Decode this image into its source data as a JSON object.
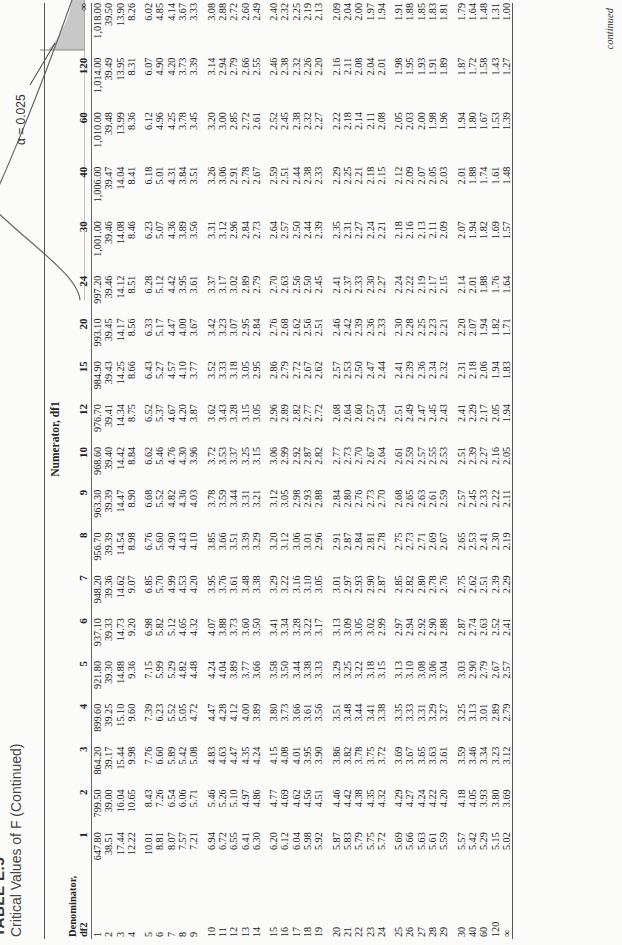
{
  "title": {
    "number": "TABLE E.5",
    "subtitle": "Critical Values of F (Continued)"
  },
  "figure": {
    "alpha_label": "α = 0.025",
    "critical_label": "F_U(α,df1,df2)",
    "zero_label": "0",
    "shade_color": "#c8c8c8"
  },
  "table": {
    "numerator_label": "Numerator, df1",
    "denominator_label_line1": "Denominator,",
    "denominator_label_line2": "df2",
    "columns": [
      "1",
      "2",
      "3",
      "4",
      "5",
      "6",
      "7",
      "8",
      "9",
      "10",
      "12",
      "15",
      "20",
      "24",
      "30",
      "40",
      "60",
      "120",
      "∞"
    ],
    "groups": [
      [
        {
          "df2": "1",
          "v": [
            "647.80",
            "799.50",
            "864.20",
            "899.60",
            "921.80",
            "937.10",
            "948.20",
            "956.70",
            "963.30",
            "968.60",
            "976.70",
            "984.90",
            "993.10",
            "997.20",
            "1,001.00",
            "1,006.00",
            "1,010.00",
            "1,014.00",
            "1,018.00"
          ]
        },
        {
          "df2": "2",
          "v": [
            "38.51",
            "39.00",
            "39.17",
            "39.25",
            "39.30",
            "39.33",
            "39.36",
            "39.39",
            "39.39",
            "39.40",
            "39.41",
            "39.43",
            "39.45",
            "39.46",
            "39.46",
            "39.47",
            "39.48",
            "39.49",
            "39.50"
          ]
        },
        {
          "df2": "3",
          "v": [
            "17.44",
            "16.04",
            "15.44",
            "15.10",
            "14.88",
            "14.73",
            "14.62",
            "14.54",
            "14.47",
            "14.42",
            "14.34",
            "14.25",
            "14.17",
            "14.12",
            "14.08",
            "14.04",
            "13.99",
            "13.95",
            "13.90"
          ]
        },
        {
          "df2": "4",
          "v": [
            "12.22",
            "10.65",
            "9.98",
            "9.60",
            "9.36",
            "9.20",
            "9.07",
            "8.98",
            "8.90",
            "8.84",
            "8.75",
            "8.66",
            "8.56",
            "8.51",
            "8.46",
            "8.41",
            "8.36",
            "8.31",
            "8.26"
          ]
        }
      ],
      [
        {
          "df2": "5",
          "v": [
            "10.01",
            "8.43",
            "7.76",
            "7.39",
            "7.15",
            "6.98",
            "6.85",
            "6.76",
            "6.68",
            "6.62",
            "6.52",
            "6.43",
            "6.33",
            "6.28",
            "6.23",
            "6.18",
            "6.12",
            "6.07",
            "6.02"
          ]
        },
        {
          "df2": "6",
          "v": [
            "8.81",
            "7.26",
            "6.60",
            "6.23",
            "5.99",
            "5.82",
            "5.70",
            "5.60",
            "5.52",
            "5.46",
            "5.37",
            "5.27",
            "5.17",
            "5.12",
            "5.07",
            "5.01",
            "4.96",
            "4.90",
            "4.85"
          ]
        },
        {
          "df2": "7",
          "v": [
            "8.07",
            "6.54",
            "5.89",
            "5.52",
            "5.29",
            "5.12",
            "4.99",
            "4.90",
            "4.82",
            "4.76",
            "4.67",
            "4.57",
            "4.47",
            "4.42",
            "4.36",
            "4.31",
            "4.25",
            "4.20",
            "4.14"
          ]
        },
        {
          "df2": "8",
          "v": [
            "7.57",
            "6.06",
            "5.42",
            "5.05",
            "4.82",
            "4.65",
            "4.53",
            "4.43",
            "4.36",
            "4.30",
            "4.20",
            "4.10",
            "4.00",
            "3.95",
            "3.89",
            "3.84",
            "3.78",
            "3.73",
            "3.67"
          ]
        },
        {
          "df2": "9",
          "v": [
            "7.21",
            "5.71",
            "5.08",
            "4.72",
            "4.48",
            "4.32",
            "4.20",
            "4.10",
            "4.03",
            "3.96",
            "3.87",
            "3.77",
            "3.67",
            "3.61",
            "3.56",
            "3.51",
            "3.45",
            "3.39",
            "3.33"
          ]
        }
      ],
      [
        {
          "df2": "10",
          "v": [
            "6.94",
            "5.46",
            "4.83",
            "4.47",
            "4.24",
            "4.07",
            "3.95",
            "3.85",
            "3.78",
            "3.72",
            "3.62",
            "3.52",
            "3.42",
            "3.37",
            "3.31",
            "3.26",
            "3.20",
            "3.14",
            "3.08"
          ]
        },
        {
          "df2": "11",
          "v": [
            "6.72",
            "5.26",
            "4.63",
            "4.28",
            "4.04",
            "3.88",
            "3.76",
            "3.66",
            "3.59",
            "3.53",
            "3.43",
            "3.33",
            "3.23",
            "3.17",
            "3.12",
            "3.06",
            "3.00",
            "2.94",
            "2.88"
          ]
        },
        {
          "df2": "12",
          "v": [
            "6.55",
            "5.10",
            "4.47",
            "4.12",
            "3.89",
            "3.73",
            "3.61",
            "3.51",
            "3.44",
            "3.37",
            "3.28",
            "3.18",
            "3.07",
            "3.02",
            "2.96",
            "2.91",
            "2.85",
            "2.79",
            "2.72"
          ]
        },
        {
          "df2": "13",
          "v": [
            "6.41",
            "4.97",
            "4.35",
            "4.00",
            "3.77",
            "3.60",
            "3.48",
            "3.39",
            "3.31",
            "3.25",
            "3.15",
            "3.05",
            "2.95",
            "2.89",
            "2.84",
            "2.78",
            "2.72",
            "2.66",
            "2.60"
          ]
        },
        {
          "df2": "14",
          "v": [
            "6.30",
            "4.86",
            "4.24",
            "3.89",
            "3.66",
            "3.50",
            "3.38",
            "3.29",
            "3.21",
            "3.15",
            "3.05",
            "2.95",
            "2.84",
            "2.79",
            "2.73",
            "2.67",
            "2.61",
            "2.55",
            "2.49"
          ]
        }
      ],
      [
        {
          "df2": "15",
          "v": [
            "6.20",
            "4.77",
            "4.15",
            "3.80",
            "3.58",
            "3.41",
            "3.29",
            "3.20",
            "3.12",
            "3.06",
            "2.96",
            "2.86",
            "2.76",
            "2.70",
            "2.64",
            "2.59",
            "2.52",
            "2.46",
            "2.40"
          ]
        },
        {
          "df2": "16",
          "v": [
            "6.12",
            "4.69",
            "4.08",
            "3.73",
            "3.50",
            "3.34",
            "3.22",
            "3.12",
            "3.05",
            "2.99",
            "2.89",
            "2.79",
            "2.68",
            "2.63",
            "2.57",
            "2.51",
            "2.45",
            "2.38",
            "2.32"
          ]
        },
        {
          "df2": "17",
          "v": [
            "6.04",
            "4.62",
            "4.01",
            "3.66",
            "3.44",
            "3.28",
            "3.16",
            "3.06",
            "2.98",
            "2.92",
            "2.82",
            "2.72",
            "2.62",
            "2.56",
            "2.50",
            "2.44",
            "2.38",
            "2.32",
            "2.25"
          ]
        },
        {
          "df2": "18",
          "v": [
            "5.98",
            "4.56",
            "3.95",
            "3.61",
            "3.38",
            "3.22",
            "3.10",
            "3.01",
            "2.93",
            "2.87",
            "2.77",
            "2.67",
            "2.56",
            "2.50",
            "2.44",
            "2.38",
            "2.32",
            "2.26",
            "2.19"
          ]
        },
        {
          "df2": "19",
          "v": [
            "5.92",
            "4.51",
            "3.90",
            "3.56",
            "3.33",
            "3.17",
            "3.05",
            "2.96",
            "2.88",
            "2.82",
            "2.72",
            "2.62",
            "2.51",
            "2.45",
            "2.39",
            "2.33",
            "2.27",
            "2.20",
            "2.13"
          ]
        }
      ],
      [
        {
          "df2": "20",
          "v": [
            "5.87",
            "4.46",
            "3.86",
            "3.51",
            "3.29",
            "3.13",
            "3.01",
            "2.91",
            "2.84",
            "2.77",
            "2.68",
            "2.57",
            "2.46",
            "2.41",
            "2.35",
            "2.29",
            "2.22",
            "2.16",
            "2.09"
          ]
        },
        {
          "df2": "21",
          "v": [
            "5.83",
            "4.42",
            "3.82",
            "3.48",
            "3.25",
            "3.09",
            "2.97",
            "2.87",
            "2.80",
            "2.73",
            "2.64",
            "2.53",
            "2.42",
            "2.37",
            "2.31",
            "2.25",
            "2.18",
            "2.11",
            "2.04"
          ]
        },
        {
          "df2": "22",
          "v": [
            "5.79",
            "4.38",
            "3.78",
            "3.44",
            "3.22",
            "3.05",
            "2.93",
            "2.84",
            "2.76",
            "2.70",
            "2.60",
            "2.50",
            "2.39",
            "2.33",
            "2.27",
            "2.21",
            "2.14",
            "2.08",
            "2.00"
          ]
        },
        {
          "df2": "23",
          "v": [
            "5.75",
            "4.35",
            "3.75",
            "3.41",
            "3.18",
            "3.02",
            "2.90",
            "2.81",
            "2.73",
            "2.67",
            "2.57",
            "2.47",
            "2.36",
            "2.30",
            "2.24",
            "2.18",
            "2.11",
            "2.04",
            "1.97"
          ]
        },
        {
          "df2": "24",
          "v": [
            "5.72",
            "4.32",
            "3.72",
            "3.38",
            "3.15",
            "2.99",
            "2.87",
            "2.78",
            "2.70",
            "2.64",
            "2.54",
            "2.44",
            "2.33",
            "2.27",
            "2.21",
            "2.15",
            "2.08",
            "2.01",
            "1.94"
          ]
        }
      ],
      [
        {
          "df2": "25",
          "v": [
            "5.69",
            "4.29",
            "3.69",
            "3.35",
            "3.13",
            "2.97",
            "2.85",
            "2.75",
            "2.68",
            "2.61",
            "2.51",
            "2.41",
            "2.30",
            "2.24",
            "2.18",
            "2.12",
            "2.05",
            "1.98",
            "1.91"
          ]
        },
        {
          "df2": "26",
          "v": [
            "5.66",
            "4.27",
            "3.67",
            "3.33",
            "3.10",
            "2.94",
            "2.82",
            "2.73",
            "2.65",
            "2.59",
            "2.49",
            "2.39",
            "2.28",
            "2.22",
            "2.16",
            "2.09",
            "2.03",
            "1.95",
            "1.88"
          ]
        },
        {
          "df2": "27",
          "v": [
            "5.63",
            "4.24",
            "3.65",
            "3.31",
            "3.08",
            "2.92",
            "2.80",
            "2.71",
            "2.63",
            "2.57",
            "2.47",
            "2.36",
            "2.25",
            "2.19",
            "2.13",
            "2.07",
            "2.00",
            "1.93",
            "1.85"
          ]
        },
        {
          "df2": "28",
          "v": [
            "5.61",
            "4.22",
            "3.63",
            "3.29",
            "3.06",
            "2.90",
            "2.78",
            "2.69",
            "2.61",
            "2.55",
            "2.45",
            "2.34",
            "2.23",
            "2.17",
            "2.11",
            "2.05",
            "1.98",
            "1.91",
            "1.83"
          ]
        },
        {
          "df2": "29",
          "v": [
            "5.59",
            "4.20",
            "3.61",
            "3.27",
            "3.04",
            "2.88",
            "2.76",
            "2.67",
            "2.59",
            "2.53",
            "2.43",
            "2.32",
            "2.21",
            "2.15",
            "2.09",
            "2.03",
            "1.96",
            "1.89",
            "1.81"
          ]
        }
      ],
      [
        {
          "df2": "30",
          "v": [
            "5.57",
            "4.18",
            "3.59",
            "3.25",
            "3.03",
            "2.87",
            "2.75",
            "2.65",
            "2.57",
            "2.51",
            "2.41",
            "2.31",
            "2.20",
            "2.14",
            "2.07",
            "2.01",
            "1.94",
            "1.87",
            "1.79"
          ]
        },
        {
          "df2": "40",
          "v": [
            "5.42",
            "4.05",
            "3.46",
            "3.13",
            "2.90",
            "2.74",
            "2.62",
            "2.53",
            "2.45",
            "2.39",
            "2.29",
            "2.18",
            "2.07",
            "2.01",
            "1.94",
            "1.88",
            "1.80",
            "1.72",
            "1.64"
          ]
        },
        {
          "df2": "60",
          "v": [
            "5.29",
            "3.93",
            "3.34",
            "3.01",
            "2.79",
            "2.63",
            "2.51",
            "2.41",
            "2.33",
            "2.27",
            "2.17",
            "2.06",
            "1.94",
            "1.88",
            "1.82",
            "1.74",
            "1.67",
            "1.58",
            "1.48"
          ]
        },
        {
          "df2": "120",
          "v": [
            "5.15",
            "3.80",
            "3.23",
            "2.89",
            "2.67",
            "2.52",
            "2.39",
            "2.30",
            "2.22",
            "2.16",
            "2.05",
            "1.94",
            "1.82",
            "1.76",
            "1.69",
            "1.61",
            "1.53",
            "1.43",
            "1.31"
          ]
        },
        {
          "df2": "∞",
          "v": [
            "5.02",
            "3.69",
            "3.12",
            "2.79",
            "2.57",
            "2.41",
            "2.29",
            "2.19",
            "2.11",
            "2.05",
            "1.94",
            "1.83",
            "1.71",
            "1.64",
            "1.57",
            "1.48",
            "1.39",
            "1.27",
            "1.00"
          ]
        }
      ]
    ]
  },
  "footer": {
    "continued": "continued"
  }
}
